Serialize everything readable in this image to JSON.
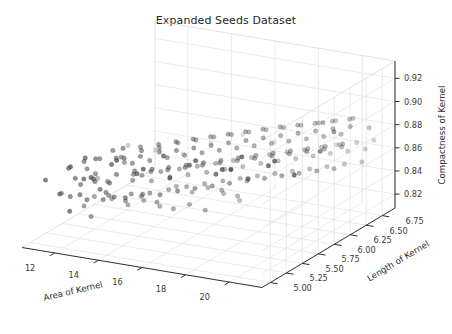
{
  "figure": {
    "width": 452,
    "height": 334,
    "background": "#ffffff",
    "title": "Expanded Seeds Dataset"
  },
  "chart_data": {
    "type": "scatter",
    "projection": "3d",
    "title": "Expanded Seeds Dataset",
    "xlabel": "Area of Kernel",
    "ylabel": "Length of Kernel",
    "zlabel": "Compactness of Kernel",
    "xlim": [
      10.5,
      21.5
    ],
    "ylim": [
      4.87,
      6.95
    ],
    "zlim": [
      0.808,
      0.935
    ],
    "xticks": [
      12,
      14,
      16,
      18,
      20
    ],
    "yticks": [
      5.0,
      5.25,
      5.5,
      5.75,
      6.0,
      6.25,
      6.5,
      6.75
    ],
    "zticks": [
      0.82,
      0.84,
      0.86,
      0.88,
      0.9,
      0.92
    ],
    "xtick_labels": [
      "12",
      "14",
      "16",
      "18",
      "20"
    ],
    "ytick_labels": [
      "5.00",
      "5.25",
      "5.50",
      "5.75",
      "6.00",
      "6.25",
      "6.50",
      "6.75"
    ],
    "ztick_labels": [
      "0.82",
      "0.84",
      "0.86",
      "0.88",
      "0.90",
      "0.92"
    ],
    "grid": true,
    "legend": false,
    "marker": {
      "shape": "circle",
      "size": 4.4,
      "color": "#4d4d4d",
      "edge_color": "#3a3a3a",
      "depth_shading": true
    },
    "view": {
      "elevation": 18,
      "azimuth": -62
    },
    "n_points": 210,
    "points": [
      [
        11.23,
        5.21,
        0.8452
      ],
      [
        11.42,
        5.31,
        0.8404
      ],
      [
        11.55,
        5.24,
        0.8676
      ],
      [
        11.66,
        5.39,
        0.8489
      ],
      [
        11.74,
        5.28,
        0.8581
      ],
      [
        11.81,
        5.17,
        0.8335
      ],
      [
        11.87,
        5.42,
        0.8621
      ],
      [
        11.94,
        5.35,
        0.871
      ],
      [
        12.01,
        5.26,
        0.8455
      ],
      [
        12.08,
        5.48,
        0.8566
      ],
      [
        12.13,
        5.33,
        0.8392
      ],
      [
        12.19,
        5.51,
        0.8689
      ],
      [
        12.26,
        5.41,
        0.8527
      ],
      [
        12.31,
        5.22,
        0.8614
      ],
      [
        12.37,
        5.57,
        0.8478
      ],
      [
        12.44,
        5.36,
        0.8745
      ],
      [
        12.49,
        5.46,
        0.8361
      ],
      [
        12.55,
        5.29,
        0.8598
      ],
      [
        12.62,
        5.62,
        0.8672
      ],
      [
        12.68,
        5.44,
        0.8436
      ],
      [
        12.73,
        5.53,
        0.8771
      ],
      [
        12.79,
        5.31,
        0.8509
      ],
      [
        12.85,
        5.67,
        0.8625
      ],
      [
        12.91,
        5.49,
        0.8387
      ],
      [
        12.97,
        5.58,
        0.8704
      ],
      [
        13.02,
        5.38,
        0.8548
      ],
      [
        13.08,
        5.72,
        0.8462
      ],
      [
        13.14,
        5.55,
        0.8796
      ],
      [
        13.19,
        5.43,
        0.8611
      ],
      [
        13.25,
        5.64,
        0.8374
      ],
      [
        13.31,
        5.51,
        0.8729
      ],
      [
        13.36,
        5.77,
        0.8497
      ],
      [
        13.42,
        5.6,
        0.8658
      ],
      [
        13.48,
        5.47,
        0.8405
      ],
      [
        13.53,
        5.69,
        0.8773
      ],
      [
        13.59,
        5.56,
        0.8582
      ],
      [
        13.65,
        5.82,
        0.8441
      ],
      [
        13.7,
        5.63,
        0.8717
      ],
      [
        13.76,
        5.52,
        0.8629
      ],
      [
        13.81,
        5.74,
        0.8368
      ],
      [
        13.87,
        5.59,
        0.8785
      ],
      [
        13.93,
        5.87,
        0.8514
      ],
      [
        13.98,
        5.68,
        0.8673
      ],
      [
        14.04,
        5.55,
        0.8427
      ],
      [
        14.1,
        5.79,
        0.8751
      ],
      [
        14.15,
        5.64,
        0.8596
      ],
      [
        14.21,
        5.92,
        0.8459
      ],
      [
        14.27,
        5.72,
        0.8808
      ],
      [
        14.32,
        5.6,
        0.8635
      ],
      [
        14.38,
        5.84,
        0.8382
      ],
      [
        14.43,
        5.68,
        0.8762
      ],
      [
        14.49,
        5.97,
        0.8521
      ],
      [
        14.55,
        5.76,
        0.869
      ],
      [
        14.6,
        5.63,
        0.8414
      ],
      [
        14.66,
        5.89,
        0.8778
      ],
      [
        14.72,
        5.71,
        0.8607
      ],
      [
        14.77,
        6.01,
        0.8466
      ],
      [
        14.83,
        5.8,
        0.8823
      ],
      [
        14.88,
        5.67,
        0.8644
      ],
      [
        14.94,
        5.93,
        0.8395
      ],
      [
        15.0,
        5.75,
        0.8769
      ],
      [
        15.05,
        6.06,
        0.8532
      ],
      [
        15.11,
        5.84,
        0.8701
      ],
      [
        15.17,
        5.71,
        0.8438
      ],
      [
        15.22,
        5.98,
        0.8791
      ],
      [
        15.28,
        5.79,
        0.8618
      ],
      [
        15.33,
        6.11,
        0.8473
      ],
      [
        15.39,
        5.88,
        0.8836
      ],
      [
        15.45,
        5.75,
        0.8657
      ],
      [
        15.5,
        6.02,
        0.8408
      ],
      [
        15.56,
        5.83,
        0.8782
      ],
      [
        15.62,
        6.15,
        0.8545
      ],
      [
        15.67,
        5.92,
        0.8714
      ],
      [
        15.73,
        5.79,
        0.8451
      ],
      [
        15.78,
        6.07,
        0.8804
      ],
      [
        15.84,
        5.87,
        0.8629
      ],
      [
        15.9,
        6.2,
        0.8486
      ],
      [
        15.95,
        5.96,
        0.8849
      ],
      [
        16.01,
        5.83,
        0.8668
      ],
      [
        16.07,
        6.11,
        0.8421
      ],
      [
        16.12,
        5.91,
        0.8795
      ],
      [
        16.18,
        6.24,
        0.8558
      ],
      [
        16.23,
        6.0,
        0.8727
      ],
      [
        16.29,
        5.87,
        0.8464
      ],
      [
        16.35,
        6.15,
        0.8817
      ],
      [
        16.4,
        5.95,
        0.864
      ],
      [
        16.46,
        6.29,
        0.8499
      ],
      [
        16.52,
        6.04,
        0.8862
      ],
      [
        16.57,
        5.91,
        0.8679
      ],
      [
        16.63,
        6.19,
        0.8434
      ],
      [
        16.68,
        5.99,
        0.8808
      ],
      [
        16.74,
        6.33,
        0.8571
      ],
      [
        16.8,
        6.08,
        0.8738
      ],
      [
        16.85,
        5.95,
        0.8477
      ],
      [
        16.91,
        6.23,
        0.883
      ],
      [
        16.97,
        6.03,
        0.8651
      ],
      [
        17.02,
        6.38,
        0.8512
      ],
      [
        17.08,
        6.12,
        0.8875
      ],
      [
        17.13,
        5.99,
        0.8692
      ],
      [
        17.19,
        6.27,
        0.8447
      ],
      [
        17.25,
        6.07,
        0.8821
      ],
      [
        17.3,
        6.42,
        0.8584
      ],
      [
        17.36,
        6.16,
        0.8749
      ],
      [
        17.42,
        6.03,
        0.849
      ],
      [
        17.47,
        6.31,
        0.8841
      ],
      [
        17.53,
        6.11,
        0.8662
      ],
      [
        17.58,
        6.46,
        0.8525
      ],
      [
        17.64,
        6.2,
        0.8888
      ],
      [
        17.7,
        6.07,
        0.8705
      ],
      [
        17.75,
        6.35,
        0.8458
      ],
      [
        17.81,
        6.15,
        0.8834
      ],
      [
        17.87,
        6.5,
        0.8597
      ],
      [
        17.92,
        6.24,
        0.876
      ],
      [
        17.98,
        6.11,
        0.8503
      ],
      [
        18.03,
        6.39,
        0.8852
      ],
      [
        18.09,
        6.19,
        0.8673
      ],
      [
        18.15,
        6.54,
        0.8538
      ],
      [
        18.2,
        6.28,
        0.8899
      ],
      [
        18.26,
        6.15,
        0.8716
      ],
      [
        18.32,
        6.43,
        0.8469
      ],
      [
        18.37,
        6.23,
        0.8845
      ],
      [
        18.43,
        6.58,
        0.861
      ],
      [
        18.48,
        6.32,
        0.8771
      ],
      [
        18.54,
        6.19,
        0.8516
      ],
      [
        18.6,
        6.47,
        0.8863
      ],
      [
        18.65,
        6.27,
        0.8684
      ],
      [
        18.71,
        6.62,
        0.8551
      ],
      [
        18.77,
        6.36,
        0.8905
      ],
      [
        18.82,
        6.23,
        0.8727
      ],
      [
        18.88,
        6.51,
        0.8481
      ],
      [
        18.93,
        6.31,
        0.8856
      ],
      [
        18.99,
        6.66,
        0.8622
      ],
      [
        19.05,
        6.4,
        0.8782
      ],
      [
        19.1,
        6.27,
        0.8529
      ],
      [
        19.16,
        6.55,
        0.8874
      ],
      [
        19.22,
        6.35,
        0.8695
      ],
      [
        19.27,
        6.7,
        0.8563
      ],
      [
        19.33,
        6.44,
        0.8912
      ],
      [
        19.38,
        6.31,
        0.8738
      ],
      [
        19.44,
        6.59,
        0.8492
      ],
      [
        19.5,
        6.39,
        0.8867
      ],
      [
        19.55,
        6.74,
        0.8634
      ],
      [
        19.61,
        6.48,
        0.8793
      ],
      [
        19.67,
        6.35,
        0.8541
      ],
      [
        19.72,
        6.63,
        0.8885
      ],
      [
        19.78,
        6.43,
        0.8706
      ],
      [
        19.83,
        6.78,
        0.8574
      ],
      [
        19.89,
        6.52,
        0.8921
      ],
      [
        19.95,
        6.39,
        0.8749
      ],
      [
        20.0,
        6.67,
        0.8504
      ],
      [
        20.06,
        6.47,
        0.8878
      ],
      [
        20.12,
        6.82,
        0.8645
      ],
      [
        20.17,
        6.56,
        0.8804
      ],
      [
        20.23,
        6.43,
        0.8552
      ],
      [
        20.28,
        6.71,
        0.8896
      ],
      [
        20.34,
        6.51,
        0.8717
      ],
      [
        20.4,
        6.86,
        0.8585
      ],
      [
        20.45,
        6.6,
        0.893
      ],
      [
        20.51,
        6.47,
        0.876
      ],
      [
        20.57,
        6.75,
        0.8515
      ],
      [
        20.62,
        6.55,
        0.8889
      ],
      [
        20.68,
        6.9,
        0.8656
      ],
      [
        11.35,
        5.55,
        0.8241
      ],
      [
        11.62,
        5.62,
        0.8308
      ],
      [
        11.88,
        5.48,
        0.819
      ],
      [
        12.15,
        5.71,
        0.8276
      ],
      [
        12.4,
        5.58,
        0.8355
      ],
      [
        12.66,
        5.79,
        0.8212
      ],
      [
        12.93,
        5.66,
        0.8298
      ],
      [
        13.18,
        5.86,
        0.8244
      ],
      [
        13.45,
        5.73,
        0.8331
      ],
      [
        13.71,
        5.93,
        0.8187
      ],
      [
        13.96,
        5.8,
        0.8273
      ],
      [
        14.23,
        6.01,
        0.8349
      ],
      [
        14.48,
        5.88,
        0.8206
      ],
      [
        14.75,
        6.08,
        0.8292
      ],
      [
        15.01,
        5.95,
        0.8238
      ],
      [
        15.27,
        6.15,
        0.8324
      ],
      [
        15.53,
        6.02,
        0.8181
      ],
      [
        15.79,
        6.22,
        0.8267
      ],
      [
        16.05,
        6.1,
        0.8343
      ],
      [
        16.31,
        6.29,
        0.82
      ],
      [
        16.57,
        6.17,
        0.8286
      ],
      [
        12.05,
        5.1,
        0.875
      ],
      [
        12.55,
        5.16,
        0.8822
      ],
      [
        13.05,
        5.08,
        0.8695
      ],
      [
        13.58,
        5.22,
        0.8778
      ],
      [
        14.08,
        5.13,
        0.8861
      ],
      [
        14.6,
        5.27,
        0.8714
      ],
      [
        15.12,
        5.19,
        0.8797
      ],
      [
        15.64,
        5.33,
        0.888
      ],
      [
        16.16,
        5.25,
        0.8733
      ],
      [
        16.68,
        5.38,
        0.8816
      ],
      [
        17.2,
        5.3,
        0.8899
      ],
      [
        17.72,
        5.44,
        0.8752
      ],
      [
        18.24,
        5.36,
        0.8835
      ],
      [
        18.76,
        5.49,
        0.8918
      ],
      [
        19.28,
        5.41,
        0.8771
      ],
      [
        19.8,
        5.55,
        0.8854
      ],
      [
        20.32,
        5.47,
        0.8937
      ],
      [
        20.84,
        5.6,
        0.879
      ],
      [
        11.05,
        5.05,
        0.862
      ],
      [
        11.52,
        6.18,
        0.8561
      ],
      [
        12.28,
        6.35,
        0.8488
      ],
      [
        13.1,
        6.5,
        0.8432
      ],
      [
        14.02,
        6.62,
        0.8516
      ],
      [
        15.2,
        6.72,
        0.8594
      ],
      [
        16.4,
        6.8,
        0.8538
      ],
      [
        17.6,
        6.88,
        0.8472
      ],
      [
        18.9,
        6.92,
        0.8556
      ],
      [
        20.1,
        6.3,
        0.8988
      ],
      [
        20.9,
        6.2,
        0.8968
      ],
      [
        19.4,
        5.1,
        0.8958
      ],
      [
        21.05,
        6.7,
        0.8842
      ],
      [
        10.9,
        5.35,
        0.8402
      ],
      [
        10.95,
        5.9,
        0.8352
      ],
      [
        21.15,
        5.9,
        0.8905
      ]
    ]
  },
  "axes": {
    "x": {
      "name": "Area of Kernel",
      "label": "Area of Kernel",
      "ticks": [
        "12",
        "14",
        "16",
        "18",
        "20"
      ]
    },
    "y": {
      "name": "Length of Kernel",
      "label": "Length of Kernel",
      "ticks": [
        "5.00",
        "5.25",
        "5.50",
        "5.75",
        "6.00",
        "6.25",
        "6.50",
        "6.75"
      ]
    },
    "z": {
      "name": "Compactness of Kernel",
      "label": "Compactness of Kernel",
      "ticks": [
        "0.82",
        "0.84",
        "0.86",
        "0.88",
        "0.90",
        "0.92"
      ]
    }
  },
  "colors": {
    "background": "#ffffff",
    "grid": "#e6e6e6",
    "axis": "#2e2e2e",
    "text": "#262626",
    "marker": "#4d4d4d"
  }
}
